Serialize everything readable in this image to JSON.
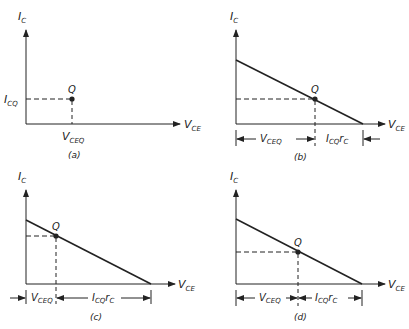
{
  "axis_labels": {
    "y_main": "I",
    "y_sub": "C",
    "x_main": "V",
    "x_sub": "CE"
  },
  "q_label": "Q",
  "panels": [
    {
      "caption": "(a)",
      "ico_main": "I",
      "ico_sub": "CQ",
      "vceq_main": "V",
      "vceq_sub": "CEQ"
    },
    {
      "caption": "(b)",
      "vceq_main": "V",
      "vceq_sub": "CEQ",
      "icq_main": "I",
      "icq_sub": "CQ",
      "icq_tail": "r",
      "icq_tail_sub": "C"
    },
    {
      "caption": "(c)",
      "vceq_main": "V",
      "vceq_sub": "CEQ",
      "icq_main": "I",
      "icq_sub": "CQ",
      "icq_tail": "r",
      "icq_tail_sub": "C"
    },
    {
      "caption": "(d)",
      "vceq_main": "V",
      "vceq_sub": "CEQ",
      "icq_main": "I",
      "icq_sub": "CQ",
      "icq_tail": "r",
      "icq_tail_sub": "C"
    }
  ],
  "colors": {
    "ink": "#222222",
    "background": "#ffffff"
  }
}
